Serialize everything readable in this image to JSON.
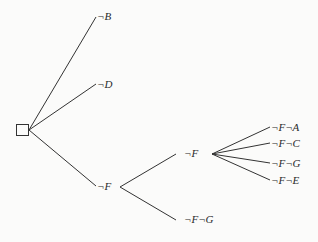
{
  "diagram": {
    "type": "decision-tree",
    "root": {
      "shape": "square"
    },
    "nodes": [
      {
        "id": "nB",
        "label": "¬B"
      },
      {
        "id": "nD",
        "label": "¬D"
      },
      {
        "id": "nF",
        "label": "¬F"
      },
      {
        "id": "nF2",
        "label": "¬F"
      },
      {
        "id": "nFG_low",
        "label": "¬F¬G"
      },
      {
        "id": "nFA",
        "label": "¬F¬A"
      },
      {
        "id": "nFC",
        "label": "¬F¬C"
      },
      {
        "id": "nFG",
        "label": "¬F¬G"
      },
      {
        "id": "nFE",
        "label": "¬F¬E"
      }
    ],
    "edges": [
      [
        "root",
        "nB"
      ],
      [
        "root",
        "nD"
      ],
      [
        "root",
        "nF"
      ],
      [
        "nF",
        "nF2"
      ],
      [
        "nF",
        "nFG_low"
      ],
      [
        "nF2",
        "nFA"
      ],
      [
        "nF2",
        "nFC"
      ],
      [
        "nF2",
        "nFG"
      ],
      [
        "nF2",
        "nFE"
      ]
    ],
    "colors": {
      "line": "#333333",
      "background": "#fbfbfa"
    }
  }
}
